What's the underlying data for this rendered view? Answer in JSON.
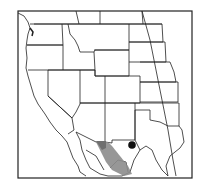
{
  "map": {
    "type": "range-map",
    "region": "Western North America",
    "colors": {
      "frame": "#222222",
      "borders": "#222222",
      "range_fill": "#8c8c8c",
      "locality_dot": "#111111",
      "background": "#ffffff"
    },
    "legend": [],
    "features": [
      {
        "name": "range-area",
        "description": "shaded distribution range"
      },
      {
        "name": "locality-point",
        "description": "isolated record dot"
      }
    ]
  }
}
